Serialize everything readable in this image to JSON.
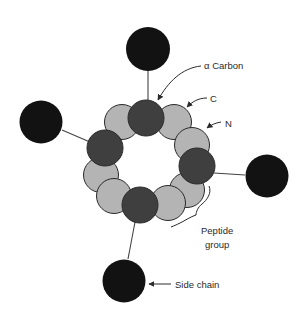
{
  "diagram": {
    "type": "alpha-helix-end-view",
    "colors": {
      "side_chain": "#121212",
      "alpha_carbon": "#3f3f3f",
      "backbone_atom": "#b4b4b4",
      "outline": "#2a2a2a",
      "line": "#444444"
    },
    "labels": {
      "alpha_carbon": "α Carbon",
      "carbon": "C",
      "nitrogen": "N",
      "peptide_group_line1": "Peptide",
      "peptide_group_line2": "group",
      "side_chain": "Side chain"
    },
    "ring_atoms": [
      {
        "kind": "light",
        "cx": 122,
        "cy": 121
      },
      {
        "kind": "light",
        "cx": 175,
        "cy": 122
      },
      {
        "kind": "light",
        "cx": 192,
        "cy": 144
      },
      {
        "kind": "dark",
        "cx": 146,
        "cy": 118
      },
      {
        "kind": "light",
        "cx": 101,
        "cy": 174
      },
      {
        "kind": "light",
        "cx": 114,
        "cy": 195
      },
      {
        "kind": "light",
        "cx": 170,
        "cy": 202
      },
      {
        "kind": "light",
        "cx": 187,
        "cy": 190
      },
      {
        "kind": "dark",
        "cx": 105,
        "cy": 148
      },
      {
        "kind": "dark",
        "cx": 197,
        "cy": 166
      },
      {
        "kind": "dark",
        "cx": 140,
        "cy": 205
      }
    ],
    "side_chains": [
      {
        "cx": 148,
        "cy": 48,
        "r": 22,
        "from": [
          148,
          100
        ],
        "to": [
          148,
          70
        ]
      },
      {
        "cx": 41,
        "cy": 121,
        "r": 22,
        "from": [
          88,
          142
        ],
        "to": [
          62,
          131
        ]
      },
      {
        "cx": 267,
        "cy": 176,
        "r": 22,
        "from": [
          216,
          173
        ],
        "to": [
          245,
          175
        ]
      },
      {
        "cx": 124,
        "cy": 281,
        "r": 22,
        "from": [
          135,
          223
        ],
        "to": [
          128,
          259
        ]
      }
    ]
  }
}
